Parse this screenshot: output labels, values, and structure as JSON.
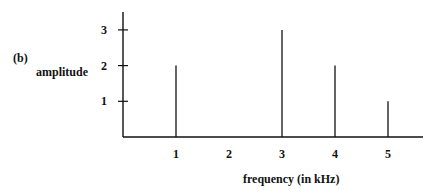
{
  "panel_label": "(b)",
  "chart_data": {
    "type": "bar",
    "subtype": "stem / line spectrum",
    "title": "",
    "xlabel": "frequency (in kHz)",
    "ylabel": "amplitude",
    "x_ticks": [
      1,
      2,
      3,
      4,
      5
    ],
    "y_ticks": [
      1,
      2,
      3
    ],
    "categories": [
      1,
      3,
      4,
      5
    ],
    "values": [
      2,
      3,
      2,
      1
    ],
    "points": [
      {
        "x": 1,
        "y": 2
      },
      {
        "x": 3,
        "y": 3
      },
      {
        "x": 4,
        "y": 2
      },
      {
        "x": 5,
        "y": 1
      }
    ],
    "xlim": [
      0,
      5.7
    ],
    "ylim": [
      0,
      3.5
    ],
    "grid": false,
    "legend": null
  },
  "colors": {
    "ink": "#111111",
    "background": "#ffffff"
  }
}
